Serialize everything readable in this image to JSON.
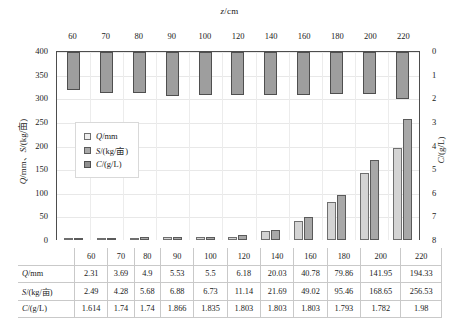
{
  "chart_data": {
    "type": "bar",
    "title": "",
    "top_axis_label": "z/cm",
    "left_axis_label_parts": {
      "sym1": "Q",
      "mid1": "/mm、",
      "sym2": "S",
      "mid2": "/(kg/亩)"
    },
    "left_axis_label": "Q/mm、S/(kg/亩)",
    "right_axis_label": "C/(g/L)",
    "xlabel": "z/cm",
    "ylabel": "Q/mm、S/(kg/亩)",
    "y2label": "C/(g/L)",
    "categories": [
      "60",
      "70",
      "80",
      "90",
      "100",
      "120",
      "140",
      "160",
      "180",
      "200",
      "220"
    ],
    "ylim": [
      0,
      400
    ],
    "yticks": [
      "0",
      "50",
      "100",
      "150",
      "200",
      "250",
      "300",
      "350",
      "400"
    ],
    "y2lim": [
      0,
      8
    ],
    "y2_inverted": true,
    "y2ticks": [
      "0",
      "1",
      "2",
      "3",
      "4",
      "5",
      "6",
      "7",
      "8"
    ],
    "grid": true,
    "legend_position": "inside-left",
    "series": [
      {
        "name": "Q/mm",
        "axis": "left",
        "color": "#d4d4d4",
        "values": [
          2.31,
          3.69,
          4.9,
          5.53,
          5.5,
          6.18,
          20.03,
          40.78,
          79.86,
          141.95,
          194.33
        ]
      },
      {
        "name": "S/(kg/亩)",
        "axis": "left",
        "color": "#a8a8a8",
        "values": [
          2.49,
          4.28,
          5.68,
          6.88,
          6.73,
          11.14,
          21.69,
          49.02,
          95.46,
          168.65,
          256.53
        ]
      },
      {
        "name": "C/(g/L)",
        "axis": "right",
        "color": "#9e9e9e",
        "values": [
          1.614,
          1.74,
          1.74,
          1.866,
          1.835,
          1.803,
          1.803,
          1.803,
          1.793,
          1.782,
          1.98
        ]
      }
    ]
  },
  "legend": {
    "items": [
      {
        "label": "Q/mm",
        "swatch": "sw-q"
      },
      {
        "label": "S/(kg/亩)",
        "swatch": "sw-s"
      },
      {
        "label": "C/(g/L)",
        "swatch": "sw-c"
      }
    ]
  },
  "table": {
    "header_row": [
      "",
      "60",
      "70",
      "80",
      "90",
      "100",
      "120",
      "140",
      "160",
      "180",
      "200",
      "220"
    ],
    "rows": [
      {
        "label": "Q/mm",
        "values": [
          "2.31",
          "3.69",
          "4.9",
          "5.53",
          "5.5",
          "6.18",
          "20.03",
          "40.78",
          "79.86",
          "141.95",
          "194.33"
        ]
      },
      {
        "label": "S/(kg/亩)",
        "values": [
          "2.49",
          "4.28",
          "5.68",
          "6.88",
          "6.73",
          "11.14",
          "21.69",
          "49.02",
          "95.46",
          "168.65",
          "256.53"
        ]
      },
      {
        "label": "C/(g/L)",
        "values": [
          "1.614",
          "1.74",
          "1.74",
          "1.866",
          "1.835",
          "1.803",
          "1.803",
          "1.803",
          "1.793",
          "1.782",
          "1.98"
        ]
      }
    ]
  }
}
